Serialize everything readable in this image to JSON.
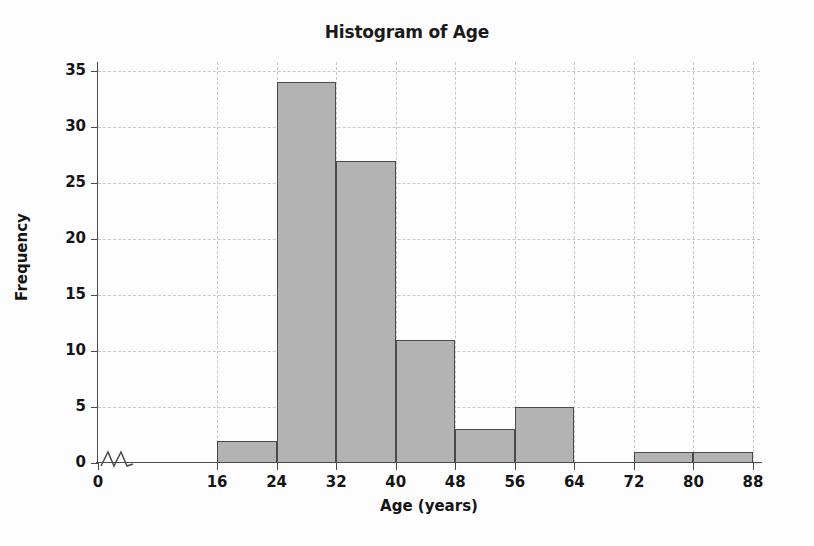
{
  "chart_data": {
    "type": "bar",
    "title": "Histogram of Age",
    "xlabel": "Age (years)",
    "ylabel": "Frequency",
    "categories": [
      "16-24",
      "24-32",
      "32-40",
      "40-48",
      "48-56",
      "56-64",
      "64-72",
      "72-80",
      "80-88"
    ],
    "bin_edges": [
      16,
      24,
      32,
      40,
      48,
      56,
      64,
      72,
      80,
      88
    ],
    "bin_width": 8,
    "values": [
      2,
      34,
      27,
      11,
      3,
      5,
      0,
      1,
      1
    ],
    "bars": [
      {
        "label": "16-24",
        "start": 16,
        "end": 24,
        "value": 2
      },
      {
        "label": "24-32",
        "start": 24,
        "end": 32,
        "value": 34
      },
      {
        "label": "32-40",
        "start": 32,
        "end": 40,
        "value": 27
      },
      {
        "label": "40-48",
        "start": 40,
        "end": 48,
        "value": 11
      },
      {
        "label": "48-56",
        "start": 48,
        "end": 56,
        "value": 3
      },
      {
        "label": "56-64",
        "start": 56,
        "end": 64,
        "value": 5
      },
      {
        "label": "64-72",
        "start": 64,
        "end": 72,
        "value": 0
      },
      {
        "label": "72-80",
        "start": 72,
        "end": 80,
        "value": 1
      },
      {
        "label": "80-88",
        "start": 80,
        "end": 88,
        "value": 1
      }
    ],
    "xlim": [
      0,
      88
    ],
    "ylim": [
      0,
      35
    ],
    "xticks": [
      0,
      16,
      24,
      32,
      40,
      48,
      56,
      64,
      72,
      80,
      88
    ],
    "yticks": [
      0,
      5,
      10,
      15,
      20,
      25,
      30,
      35
    ],
    "xtick_labels": [
      "0",
      "16",
      "24",
      "32",
      "40",
      "48",
      "56",
      "64",
      "72",
      "80",
      "88"
    ],
    "ytick_labels": [
      "0",
      "5",
      "10",
      "15",
      "20",
      "25",
      "30",
      "35"
    ],
    "grid": true,
    "grid_style": "dashed",
    "legend": null,
    "axis_break": {
      "axis": "x",
      "between": [
        0,
        16
      ],
      "symbol": "zigzag"
    },
    "colors": {
      "bar_fill": "#b3b3b3",
      "bar_edge": "#4a4a4a",
      "grid": "#c9c9c9",
      "axis": "#4a4a4a",
      "text": "#151515",
      "background": "#fdfdfd"
    }
  }
}
